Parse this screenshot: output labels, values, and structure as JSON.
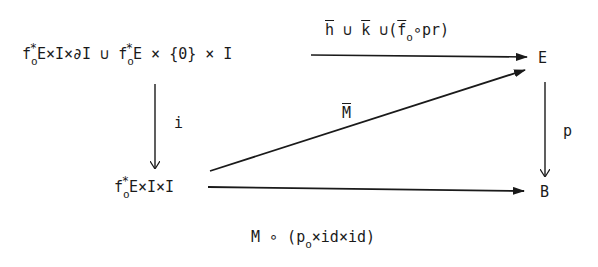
{
  "nodes": {
    "top_left": {
      "parts": [
        "f",
        "*",
        "o",
        "E×I×∂I ∪ f",
        "*",
        "o",
        "E × {0} × I"
      ]
    },
    "top_right": {
      "label": "E"
    },
    "bottom_left": {
      "parts": [
        "f",
        "*",
        "o",
        "E×I×I"
      ]
    },
    "bottom_right": {
      "label": "B"
    }
  },
  "arrows": {
    "top": {
      "parts": [
        "h",
        " ∪ ",
        "k",
        " ∪(",
        "f",
        "o",
        "∘pr)"
      ]
    },
    "left": {
      "label": "i"
    },
    "right": {
      "label": "p"
    },
    "diagonal": {
      "label": "M"
    },
    "bottom": {
      "parts": [
        "M ∘ (p",
        "o",
        "×id×id)"
      ]
    }
  },
  "colors": {
    "ink": "#1a1a1a",
    "background": "#ffffff"
  }
}
